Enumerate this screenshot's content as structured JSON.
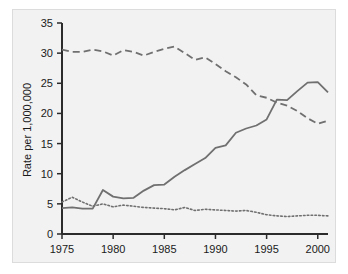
{
  "chart_data": {
    "type": "line",
    "title": "",
    "subtitle": "",
    "xlabel": "",
    "ylabel": "Rate per 1,000,000",
    "xlim": [
      1975,
      2001
    ],
    "ylim": [
      0,
      35
    ],
    "xticks": [
      1975,
      1980,
      1985,
      1990,
      1995,
      2000
    ],
    "xticklabels": [
      "1975",
      "1980",
      "1985",
      "1990",
      "1995",
      "2000"
    ],
    "yticks": [
      0,
      5,
      10,
      15,
      20,
      25,
      30,
      35
    ],
    "yticklabels": [
      "0",
      "5",
      "10",
      "15",
      "20",
      "25",
      "30",
      "35"
    ],
    "grid": false,
    "legend": "none",
    "plot_background": "#f2f2f2",
    "line_color": "#707070",
    "axis_color": "#2b2b2b",
    "x": [
      1975,
      1976,
      1977,
      1978,
      1979,
      1980,
      1981,
      1982,
      1983,
      1984,
      1985,
      1986,
      1987,
      1988,
      1989,
      1990,
      1991,
      1992,
      1993,
      1994,
      1995,
      1996,
      1997,
      1998,
      1999,
      2000,
      2001
    ],
    "series": [
      {
        "name": "dashed-series",
        "style": "dashed",
        "values": [
          30.6,
          30.2,
          30.2,
          30.6,
          30.3,
          29.6,
          30.5,
          30.2,
          29.6,
          30.2,
          30.7,
          31.1,
          30.0,
          28.9,
          29.3,
          28.2,
          27.0,
          26.0,
          24.8,
          23.0,
          22.6,
          21.8,
          21.3,
          20.4,
          19.2,
          18.3,
          18.8
        ]
      },
      {
        "name": "solid-series",
        "style": "solid",
        "values": [
          4.3,
          4.4,
          4.2,
          4.2,
          7.3,
          6.2,
          5.9,
          6.0,
          7.2,
          8.1,
          8.2,
          9.5,
          10.6,
          11.6,
          12.6,
          14.3,
          14.7,
          16.8,
          17.5,
          18.0,
          19.0,
          22.3,
          22.2,
          23.7,
          25.1,
          25.2,
          23.5
        ]
      },
      {
        "name": "dotted-series",
        "style": "dotted",
        "values": [
          5.3,
          6.1,
          5.3,
          4.6,
          5.0,
          4.5,
          4.8,
          4.6,
          4.4,
          4.3,
          4.2,
          4.0,
          4.4,
          3.9,
          4.1,
          4.0,
          3.9,
          3.8,
          3.9,
          3.6,
          3.2,
          3.0,
          2.9,
          3.0,
          3.1,
          3.1,
          3.0
        ]
      }
    ]
  }
}
